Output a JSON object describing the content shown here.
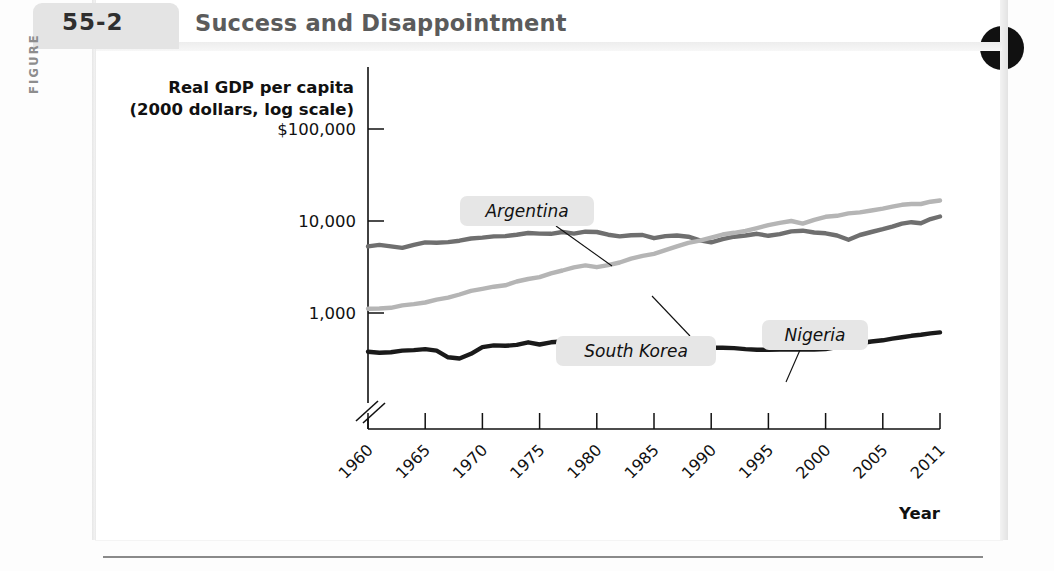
{
  "figure": {
    "kicker": "FIGURE",
    "number": "55-2",
    "title": "Success and Disappointment"
  },
  "chart_data": {
    "type": "line",
    "title": "Success and Disappointment",
    "xlabel": "Year",
    "ylabel": "Real GDP per capita (2000 dollars, log scale)",
    "ylabel_line1": "Real GDP per capita",
    "ylabel_line2": "(2000 dollars, log scale)",
    "y_scale": "log",
    "y_tick_labels": [
      "$100,000",
      "10,000",
      "1,000"
    ],
    "y_tick_values": [
      100000,
      10000,
      1000
    ],
    "ylim": [
      300,
      100000
    ],
    "axis_break": true,
    "grid": false,
    "legend_position": "inline-callouts",
    "x_tick_labels": [
      "1960",
      "1965",
      "1970",
      "1975",
      "1980",
      "1985",
      "1990",
      "1995",
      "2000",
      "2005",
      "2011"
    ],
    "x_tick_values": [
      1960,
      1965,
      1970,
      1975,
      1980,
      1985,
      1990,
      1995,
      2000,
      2005,
      2011
    ],
    "xlim": [
      1960,
      2011
    ],
    "series": [
      {
        "name": "Argentina",
        "color": "#6f6f6f",
        "x": [
          1960,
          1961,
          1962,
          1963,
          1964,
          1965,
          1966,
          1967,
          1968,
          1969,
          1970,
          1971,
          1972,
          1973,
          1974,
          1975,
          1976,
          1977,
          1978,
          1979,
          1980,
          1981,
          1982,
          1983,
          1984,
          1985,
          1986,
          1987,
          1988,
          1989,
          1990,
          1991,
          1992,
          1993,
          1994,
          1995,
          1996,
          1997,
          1998,
          1999,
          2000,
          2001,
          2002,
          2003,
          2004,
          2005,
          2006,
          2007,
          2008,
          2009,
          2010,
          2011
        ],
        "values": [
          5300,
          5500,
          5300,
          5100,
          5500,
          5850,
          5800,
          5900,
          6100,
          6450,
          6600,
          6800,
          6850,
          7100,
          7400,
          7300,
          7250,
          7600,
          7300,
          7650,
          7600,
          7100,
          6800,
          7000,
          7050,
          6500,
          6850,
          6950,
          6750,
          6150,
          5850,
          6350,
          6750,
          6950,
          7250,
          6900,
          7200,
          7700,
          7850,
          7500,
          7350,
          6950,
          6250,
          7050,
          7600,
          8150,
          8700,
          9350,
          9700,
          9450,
          10500,
          11200
        ],
        "label_at_x": 1979,
        "final_value": 11200
      },
      {
        "name": "South Korea",
        "color": "#b5b5b5",
        "x": [
          1960,
          1961,
          1962,
          1963,
          1964,
          1965,
          1966,
          1967,
          1968,
          1969,
          1970,
          1971,
          1972,
          1973,
          1974,
          1975,
          1976,
          1977,
          1978,
          1979,
          1980,
          1981,
          1982,
          1983,
          1984,
          1985,
          1986,
          1987,
          1988,
          1989,
          1990,
          1991,
          1992,
          1993,
          1994,
          1995,
          1996,
          1997,
          1998,
          1999,
          2000,
          2001,
          2002,
          2003,
          2004,
          2005,
          2006,
          2007,
          2008,
          2009,
          2010,
          2011
        ],
        "values": [
          1110,
          1120,
          1140,
          1210,
          1250,
          1300,
          1400,
          1470,
          1590,
          1740,
          1830,
          1930,
          2000,
          2200,
          2340,
          2450,
          2700,
          2900,
          3130,
          3290,
          3150,
          3320,
          3540,
          3890,
          4170,
          4400,
          4830,
          5300,
          5800,
          6100,
          6600,
          7130,
          7450,
          7830,
          8380,
          9000,
          9560,
          10000,
          9380,
          10300,
          11100,
          11400,
          12100,
          12400,
          13000,
          13600,
          14300,
          15000,
          15300,
          15300,
          16200,
          16700
        ],
        "label_at_x": 1994,
        "final_value": 16700
      },
      {
        "name": "Nigeria",
        "color": "#1a1a1a",
        "x": [
          1960,
          1961,
          1962,
          1963,
          1964,
          1965,
          1966,
          1967,
          1968,
          1969,
          1970,
          1971,
          1972,
          1973,
          1974,
          1975,
          1976,
          1977,
          1978,
          1979,
          1980,
          1981,
          1982,
          1983,
          1984,
          1985,
          1986,
          1987,
          1988,
          1989,
          1990,
          1991,
          1992,
          1993,
          1994,
          1995,
          1996,
          1997,
          1998,
          1999,
          2000,
          2001,
          2002,
          2003,
          2004,
          2005,
          2006,
          2007,
          2008,
          2009,
          2010,
          2011
        ],
        "values": [
          380,
          370,
          375,
          390,
          395,
          405,
          390,
          330,
          320,
          360,
          425,
          445,
          440,
          450,
          480,
          455,
          480,
          490,
          465,
          480,
          480,
          455,
          440,
          400,
          385,
          400,
          395,
          395,
          405,
          410,
          420,
          420,
          415,
          405,
          398,
          398,
          400,
          400,
          402,
          400,
          405,
          425,
          450,
          470,
          490,
          505,
          525,
          545,
          565,
          580,
          600,
          615
        ],
        "label_at_x": 2000,
        "final_value": 615
      }
    ]
  }
}
